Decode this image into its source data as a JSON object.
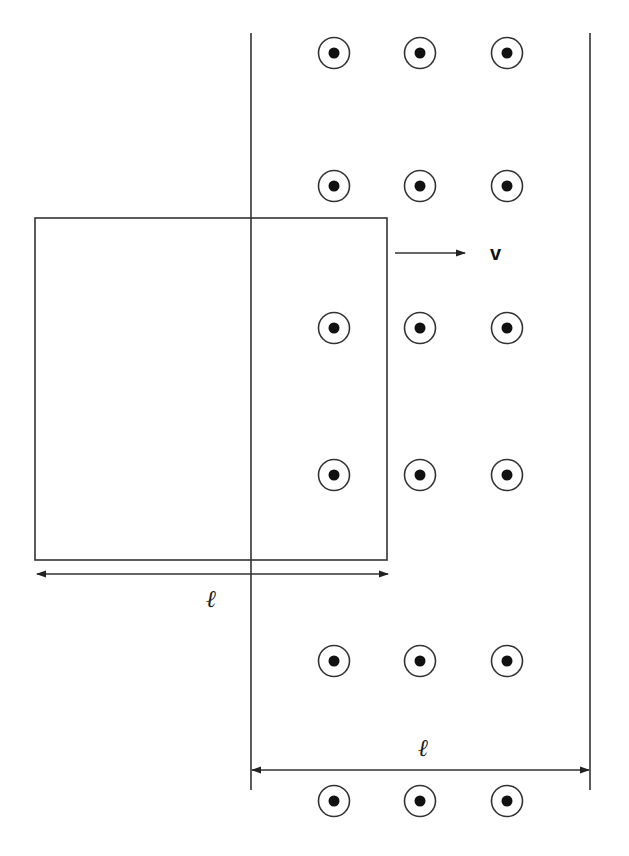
{
  "diagram": {
    "colors": {
      "stroke": "#333333",
      "dot": "#111111",
      "background": "#ffffff"
    },
    "field_region": {
      "left_boundary_x": 251,
      "right_boundary_x": 590,
      "top_y": 33,
      "bottom_y": 790,
      "field_symbol": "out-of-page (dot in circle)",
      "symbol_columns_x": [
        334,
        420,
        507
      ],
      "symbol_rows_y": [
        53,
        186,
        328,
        475,
        661,
        801
      ],
      "width_label": "ℓ"
    },
    "loop": {
      "x": 35,
      "y": 218,
      "width": 352,
      "height": 342,
      "width_label": "ℓ"
    },
    "velocity": {
      "label": "v",
      "direction": "right"
    },
    "labels": {
      "loop_width": "ℓ",
      "field_width": "ℓ",
      "velocity": "v"
    }
  }
}
